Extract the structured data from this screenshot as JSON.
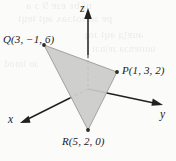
{
  "figure": {
    "name": "3d-triangle-pqr",
    "background_color": "#fbfbfa",
    "triangle_fill_color": "#cbcbca",
    "axis_color": "#211f20"
  },
  "axes": [
    {
      "key": "x",
      "label": "x",
      "direction": "down-left"
    },
    {
      "key": "y",
      "label": "y",
      "direction": "right"
    },
    {
      "key": "z",
      "label": "z",
      "direction": "up"
    }
  ],
  "points": [
    {
      "key": "Q",
      "name": "Q",
      "label": "Q(3, −1, 6)",
      "coords": [
        3,
        -1,
        6
      ],
      "px": [
        44,
        45
      ]
    },
    {
      "key": "P",
      "name": "P",
      "label": "P(1, 3, 2)",
      "coords": [
        1,
        3,
        2
      ],
      "px": [
        117,
        72
      ]
    },
    {
      "key": "R",
      "name": "R",
      "label": "R(5, 2, 0)",
      "coords": [
        5,
        2,
        0
      ],
      "px": [
        88,
        130
      ]
    }
  ],
  "ghost_text": [
    "ni bε eɹɐ 9 ɔ ǝ",
    "pɐ ɹo ɹoʇɔǝʌ ǝɥʇ ʇɐɥʇ",
    "ǝuɐןд ǝɥʇ ɹoɟ",
    "uoıʇɐnɔǝ ɹɐןnɔı",
    "ɹo ʇuıod"
  ]
}
